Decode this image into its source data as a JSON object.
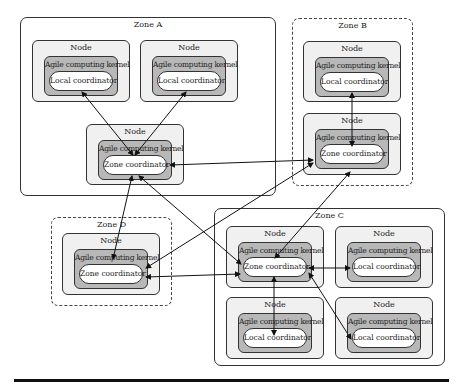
{
  "diagram": {
    "labels": {
      "node": "Node",
      "kernel": "Agile computing kernel",
      "local": "Local coordinator",
      "zone_coord": "Zone coordinator"
    },
    "zones": [
      {
        "id": "A",
        "label": "Zone A",
        "border": "solid"
      },
      {
        "id": "B",
        "label": "Zone B",
        "border": "dotted"
      },
      {
        "id": "C",
        "label": "Zone C",
        "border": "solid"
      },
      {
        "id": "D",
        "label": "Zone D",
        "border": "dotted"
      }
    ],
    "nodes": [
      {
        "zone": "A",
        "role": "local"
      },
      {
        "zone": "A",
        "role": "local"
      },
      {
        "zone": "A",
        "role": "zone_coordinator"
      },
      {
        "zone": "B",
        "role": "local"
      },
      {
        "zone": "B",
        "role": "zone_coordinator"
      },
      {
        "zone": "D",
        "role": "zone_coordinator"
      },
      {
        "zone": "C",
        "role": "zone_coordinator"
      },
      {
        "zone": "C",
        "role": "local"
      },
      {
        "zone": "C",
        "role": "local"
      },
      {
        "zone": "C",
        "role": "local"
      }
    ],
    "edges": [
      {
        "from": "A-local-1",
        "to": "A-zone",
        "direction": "bidirectional"
      },
      {
        "from": "A-local-2",
        "to": "A-zone",
        "direction": "bidirectional"
      },
      {
        "from": "A-zone",
        "to": "B-zone",
        "direction": "bidirectional"
      },
      {
        "from": "A-zone",
        "to": "D-zone",
        "direction": "bidirectional"
      },
      {
        "from": "A-zone",
        "to": "C-zone",
        "direction": "bidirectional"
      },
      {
        "from": "B-local",
        "to": "B-zone",
        "direction": "bidirectional"
      },
      {
        "from": "B-zone",
        "to": "D-zone",
        "direction": "bidirectional"
      },
      {
        "from": "B-zone",
        "to": "C-zone",
        "direction": "bidirectional"
      },
      {
        "from": "D-zone",
        "to": "C-zone",
        "direction": "bidirectional"
      },
      {
        "from": "C-zone",
        "to": "C-local-right",
        "direction": "bidirectional"
      },
      {
        "from": "C-zone",
        "to": "C-local-bottom-left",
        "direction": "bidirectional"
      },
      {
        "from": "C-zone",
        "to": "C-local-bottom-right",
        "direction": "bidirectional"
      }
    ],
    "colors": {
      "node_fill": "#f0f0f0",
      "kernel_fill": "#b8b8b8",
      "coordinator_fill": "#ffffff",
      "stroke": "#333333"
    }
  }
}
